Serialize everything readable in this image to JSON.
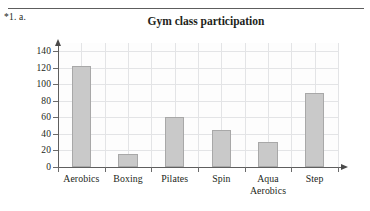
{
  "document": {
    "question_label": "*1. a.",
    "rule": "horizontal-rule"
  },
  "chart_data": {
    "type": "bar",
    "title": "Gym class participation",
    "xlabel": "",
    "ylabel": "",
    "categories": [
      "Aerobics",
      "Boxing",
      "Pilates",
      "Spin",
      "Aqua Aerobics",
      "Step"
    ],
    "category_lines": [
      [
        "Aerobics"
      ],
      [
        "Boxing"
      ],
      [
        "Pilates"
      ],
      [
        "Spin"
      ],
      [
        "Aqua",
        "Aerobics"
      ],
      [
        "Step"
      ]
    ],
    "values": [
      122,
      16,
      60,
      45,
      30,
      90
    ],
    "ylim": [
      0,
      150
    ],
    "yticks": [
      0,
      20,
      40,
      60,
      80,
      100,
      120,
      140
    ],
    "ytick_labels": [
      "0",
      "20",
      "40",
      "60",
      "80",
      "100",
      "120",
      "140"
    ],
    "grid": true,
    "legend": false,
    "bar_fill": "#c9c9c9",
    "bar_edge": "#a8a8a8",
    "axis_color": "#5e5e5e",
    "grid_color": "#e3e4e6"
  }
}
